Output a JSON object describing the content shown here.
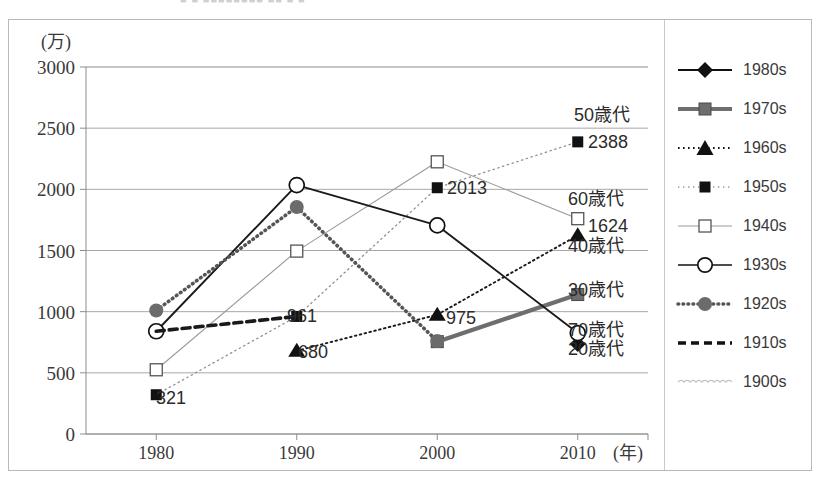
{
  "top_strip": {
    "residual_text": "■  ■   ■■■■■■■■  ■■   ■   ■"
  },
  "axes": {
    "y_unit_label": "(万)",
    "x_unit_label": "(年)",
    "y_ticks": [
      "3000",
      "2500",
      "2000",
      "1500",
      "1000",
      "500",
      "0"
    ],
    "x_ticks": [
      "1980",
      "1990",
      "2000",
      "2010"
    ]
  },
  "legend": {
    "items": [
      {
        "label": "1980s",
        "key": "solid-diamond"
      },
      {
        "label": "1970s",
        "key": "thick-grey-square"
      },
      {
        "label": "1960s",
        "key": "dotted-triangle"
      },
      {
        "label": "1950s",
        "key": "dotted-light-square"
      },
      {
        "label": "1940s",
        "key": "thin-open-square"
      },
      {
        "label": "1930s",
        "key": "solid-open-circle"
      },
      {
        "label": "1920s",
        "key": "dotted-filled-circle"
      },
      {
        "label": "1910s",
        "key": "dashed-bold"
      },
      {
        "label": "1900s",
        "key": "wavy-light"
      }
    ]
  },
  "annotations": [
    {
      "text": "50歳代",
      "x": 574,
      "y": 121
    },
    {
      "text": "2388",
      "x": 588,
      "y": 148
    },
    {
      "text": "60歳代",
      "x": 568,
      "y": 205
    },
    {
      "text": "1624",
      "x": 588,
      "y": 232
    },
    {
      "text": "40歳代",
      "x": 568,
      "y": 252
    },
    {
      "text": "30歳代",
      "x": 568,
      "y": 296
    },
    {
      "text": "70歳代",
      "x": 568,
      "y": 336
    },
    {
      "text": "20歳代",
      "x": 568,
      "y": 355
    },
    {
      "text": "2013",
      "x": 447,
      "y": 194
    },
    {
      "text": "975",
      "x": 446,
      "y": 324
    },
    {
      "text": "961",
      "x": 287,
      "y": 322
    },
    {
      "text": "680",
      "x": 298,
      "y": 358
    },
    {
      "text": "321",
      "x": 156,
      "y": 404
    }
  ],
  "chart_data": {
    "type": "line",
    "title": "",
    "xlabel": "(年)",
    "ylabel": "(万)",
    "x": [
      1980,
      1990,
      2000,
      2010
    ],
    "xlim": [
      1975,
      2015
    ],
    "ylim": [
      0,
      3000
    ],
    "grid": true,
    "legend_position": "right",
    "series": [
      {
        "name": "1980s",
        "marker": "filled-diamond",
        "line": "solid",
        "color": "#1a1a1a",
        "x": [
          2010
        ],
        "values": [
          735
        ],
        "end_label": "20歳代"
      },
      {
        "name": "1970s",
        "marker": "filled-square",
        "line": "thick-solid",
        "color": "#6e6e6e",
        "x": [
          2000,
          2010
        ],
        "values": [
          755,
          1140
        ],
        "end_label": "30歳代"
      },
      {
        "name": "1960s",
        "marker": "filled-triangle",
        "line": "dotted",
        "color": "#1a1a1a",
        "x": [
          1990,
          2000,
          2010
        ],
        "values": [
          680,
          975,
          1624
        ],
        "data_labels": [
          680,
          975,
          1624
        ],
        "end_label": "40歳代"
      },
      {
        "name": "1950s",
        "marker": "filled-square-small",
        "line": "dotted-light",
        "color": "#1a1a1a",
        "x": [
          1980,
          1990,
          2000,
          2010
        ],
        "values": [
          321,
          961,
          2013,
          2388
        ],
        "data_labels": [
          321,
          961,
          2013,
          2388
        ],
        "end_label": "50歳代"
      },
      {
        "name": "1940s",
        "marker": "open-square",
        "line": "thin-solid",
        "color": "#9a9a9a",
        "x": [
          1980,
          1990,
          2000,
          2010
        ],
        "values": [
          525,
          1495,
          2225,
          1760
        ],
        "end_label": "60歳代"
      },
      {
        "name": "1930s",
        "marker": "open-circle",
        "line": "solid",
        "color": "#1a1a1a",
        "x": [
          1980,
          1990,
          2000,
          2010
        ],
        "values": [
          840,
          2035,
          1705,
          825
        ],
        "end_label": "70歳代"
      },
      {
        "name": "1920s",
        "marker": "filled-circle",
        "line": "dotted-thick",
        "color": "#555555",
        "x": [
          1980,
          1990,
          2000
        ],
        "values": [
          1010,
          1855,
          760
        ],
        "end_label": ""
      },
      {
        "name": "1910s",
        "marker": "none",
        "line": "dashed-bold",
        "color": "#1a1a1a",
        "x": [
          1980,
          1990
        ],
        "values": [
          840,
          961
        ],
        "end_label": ""
      },
      {
        "name": "1900s",
        "marker": "none",
        "line": "wavy",
        "color": "#bdbdbd",
        "x": [],
        "values": [],
        "end_label": ""
      }
    ]
  }
}
